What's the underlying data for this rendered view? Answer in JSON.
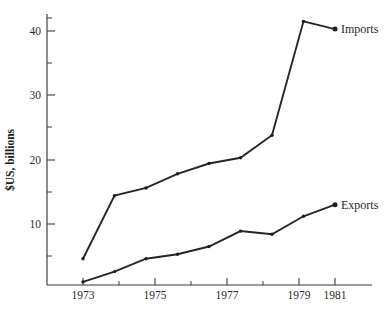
{
  "chart_data": {
    "type": "line",
    "title": "",
    "subtitle": "",
    "xlabel": "",
    "ylabel": "$US, billions",
    "x": [
      1973,
      1974,
      1975,
      1976,
      1977,
      1978,
      1979,
      1980,
      1981
    ],
    "xlim": [
      1972.2,
      1982.0
    ],
    "ylim": [
      0,
      44
    ],
    "grid": false,
    "legend_position": "right-of-line-ends",
    "xtick_labels": [
      "1973",
      "1975",
      "1977",
      "1979",
      "1981"
    ],
    "xtick_values": [
      1973,
      1975,
      1977,
      1979,
      1981
    ],
    "xtick_minor_values": [
      1974,
      1976,
      1978,
      1980
    ],
    "ytick_labels": [
      "10",
      "20",
      "30",
      "40"
    ],
    "ytick_values": [
      10,
      20,
      30,
      40
    ],
    "ytick_minor_values": [
      5,
      15,
      25,
      35,
      43
    ],
    "series": [
      {
        "name": "Imports",
        "label": "Imports",
        "color": "#262624",
        "values": [
          4.6,
          14.4,
          15.6,
          17.8,
          19.4,
          20.3,
          23.8,
          41.5,
          40.3
        ]
      },
      {
        "name": "Exports",
        "label": "Exports",
        "color": "#262624",
        "values": [
          1.0,
          2.6,
          4.6,
          5.3,
          6.5,
          8.9,
          8.4,
          11.2,
          13.0
        ]
      }
    ]
  },
  "axes": {
    "y_title": "$US, billions"
  },
  "labels": {
    "imports": "Imports",
    "exports": "Exports"
  }
}
